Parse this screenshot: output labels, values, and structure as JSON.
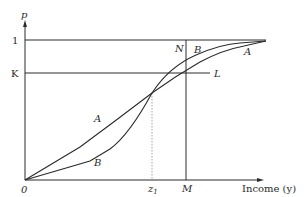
{
  "diagram": {
    "y_axis_label": "p",
    "x_axis_label": "Income (y)",
    "origin_label": "0",
    "y_ticks": {
      "one": "1",
      "k": "K"
    },
    "x_ticks": {
      "z1_base": "z",
      "z1_sub": "1",
      "m": "M"
    },
    "line_labels": {
      "n": "N",
      "l": "L"
    },
    "curves": [
      {
        "name": "A",
        "label_upper": "A",
        "label_lower": "A"
      },
      {
        "name": "B",
        "label_upper": "B",
        "label_lower": "B"
      }
    ],
    "colors": {
      "line": "#2a2a2a",
      "guide": "#8a8a8a"
    }
  }
}
